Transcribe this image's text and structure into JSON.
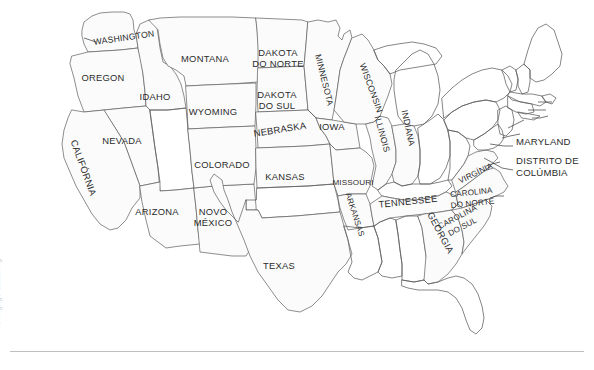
{
  "figure": {
    "name": "mapa-dos-estados-unidos",
    "language": "pt",
    "credit": "© Cengage Learning",
    "colors": {
      "state_fill": "#fbfbfc",
      "state_stroke": "#5d5d5d",
      "label_text": "#2b2b2b",
      "credit_text": "#c9c9c9",
      "background": "#ffffff",
      "rule": "#bfbfbf"
    }
  },
  "labels": [
    {
      "id": "washington",
      "text": "WASHINGTON",
      "x": 124,
      "y": 38,
      "rotate": -8,
      "size": "small"
    },
    {
      "id": "oregon",
      "text": "OREGON",
      "x": 103,
      "y": 78,
      "rotate": 0,
      "size": ""
    },
    {
      "id": "idaho",
      "text": "IDAHO",
      "x": 155,
      "y": 97,
      "rotate": 0,
      "size": ""
    },
    {
      "id": "montana",
      "text": "MONTANA",
      "x": 205,
      "y": 59,
      "rotate": 0,
      "size": ""
    },
    {
      "id": "wyoming",
      "text": "WYOMING",
      "x": 213,
      "y": 112,
      "rotate": 0,
      "size": ""
    },
    {
      "id": "nevada",
      "text": "NEVADA",
      "x": 122,
      "y": 141,
      "rotate": 0,
      "size": ""
    },
    {
      "id": "california",
      "text": "CALIFÓRNIA",
      "x": 83,
      "y": 168,
      "rotate": 70,
      "size": ""
    },
    {
      "id": "arizona",
      "text": "ARIZONA",
      "x": 157,
      "y": 212,
      "rotate": 0,
      "size": ""
    },
    {
      "id": "novo-mexico",
      "text": "NOVO\nMÉXICO",
      "x": 213,
      "y": 217,
      "rotate": 0,
      "size": ""
    },
    {
      "id": "colorado",
      "text": "COLORADO",
      "x": 222,
      "y": 165,
      "rotate": 0,
      "size": ""
    },
    {
      "id": "texas",
      "text": "TEXAS",
      "x": 279,
      "y": 266,
      "rotate": 0,
      "size": ""
    },
    {
      "id": "dakota-do-norte",
      "text": "DAKOTA\nDO NORTE",
      "x": 278,
      "y": 58,
      "rotate": 0,
      "size": ""
    },
    {
      "id": "dakota-do-sul",
      "text": "DAKOTA\nDO SUL",
      "x": 277,
      "y": 100,
      "rotate": 0,
      "size": ""
    },
    {
      "id": "nebraska",
      "text": "NEBRASKA",
      "x": 280,
      "y": 130,
      "rotate": -9,
      "size": ""
    },
    {
      "id": "kansas",
      "text": "KANSAS",
      "x": 285,
      "y": 177,
      "rotate": 0,
      "size": ""
    },
    {
      "id": "minnesota",
      "text": "MINNESOTA",
      "x": 324,
      "y": 80,
      "rotate": 76,
      "size": "small"
    },
    {
      "id": "iowa",
      "text": "IOWA",
      "x": 332,
      "y": 127,
      "rotate": 0,
      "size": ""
    },
    {
      "id": "missouri",
      "text": "MISSOURI",
      "x": 353,
      "y": 183,
      "rotate": 0,
      "size": "tiny"
    },
    {
      "id": "arkansas",
      "text": "ARKANSAS",
      "x": 354,
      "y": 215,
      "rotate": 72,
      "size": "tiny"
    },
    {
      "id": "wisconsin",
      "text": "WISCONSIN",
      "x": 371,
      "y": 88,
      "rotate": 70,
      "size": "small"
    },
    {
      "id": "illinois",
      "text": "ILLINOIS",
      "x": 382,
      "y": 134,
      "rotate": 75,
      "size": "small"
    },
    {
      "id": "indiana",
      "text": "INDIANA",
      "x": 408,
      "y": 128,
      "rotate": 78,
      "size": "small"
    },
    {
      "id": "tennessee",
      "text": "TENNESSEE",
      "x": 408,
      "y": 202,
      "rotate": -6,
      "size": ""
    },
    {
      "id": "virginia",
      "text": "VIRGÍNIA",
      "x": 476,
      "y": 174,
      "rotate": -26,
      "size": "tiny"
    },
    {
      "id": "carolina-do-norte",
      "text": "CAROLINA\nDO NORTE",
      "x": 472,
      "y": 198,
      "rotate": -6,
      "size": "tiny"
    },
    {
      "id": "carolina-do-sul",
      "text": "CAROLINA\nDO SUL",
      "x": 460,
      "y": 222,
      "rotate": -28,
      "size": "tiny"
    },
    {
      "id": "georgia",
      "text": "GEORGIA",
      "x": 440,
      "y": 233,
      "rotate": 62,
      "size": ""
    }
  ],
  "callouts": [
    {
      "id": "maryland",
      "text": "MARYLAND",
      "x": 516,
      "y": 142
    },
    {
      "id": "distrito-de-columbia",
      "text": "DISTRITO DE\nCOLÚMBIA",
      "x": 516,
      "y": 166
    }
  ]
}
